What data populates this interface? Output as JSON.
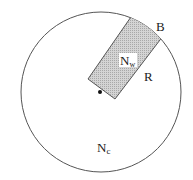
{
  "diagram": {
    "labels": {
      "boundary": "B",
      "rect_side": "R",
      "inner_main": "N",
      "inner_sub": "w",
      "outer_main": "N",
      "outer_sub": "c"
    },
    "colors": {
      "outline": "#555555",
      "fill_rect": "#c8c8c8",
      "background": "#ffffff",
      "dot": "#111111"
    }
  }
}
